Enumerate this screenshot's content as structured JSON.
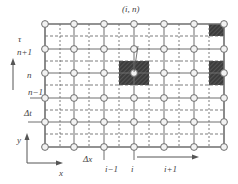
{
  "diagram": {
    "colors": {
      "grid_solid": "#6e6e6e",
      "grid_dashed": "#5a5a5a",
      "node_fill": "#f2f2f2",
      "node_stroke": "#6e6e6e",
      "cell_fill": "#3c3c3c",
      "text": "#444444"
    },
    "node_columns_x": [
      45,
      74,
      104,
      134,
      164,
      194,
      224
    ],
    "node_rows_y": [
      24,
      49,
      73,
      98,
      122,
      147
    ],
    "dashed_columns_x": [
      60,
      89,
      119,
      149,
      179,
      209
    ],
    "dashed_rows_y": [
      36,
      61,
      85,
      110,
      134
    ],
    "shaded_cells": [
      {
        "name": "cell-i-n",
        "x": 119,
        "y": 61,
        "w": 30,
        "h": 24
      },
      {
        "name": "cell-top-right",
        "x": 209,
        "y": 24,
        "w": 15,
        "h": 12
      },
      {
        "name": "cell-right-n",
        "x": 209,
        "y": 61,
        "w": 15,
        "h": 24
      }
    ],
    "labels": {
      "time_axis": "τ",
      "row_n_plus_1": "n+1",
      "row_n": "n",
      "row_n_minus_1": "n−1",
      "delta_t": "Δt",
      "delta_x": "Δx",
      "col_i_minus_1": "i−1",
      "col_i": "i",
      "col_i_plus_1": "i+1",
      "axis_y": "y",
      "axis_x": "x",
      "node_callout": "(i, n)"
    }
  }
}
